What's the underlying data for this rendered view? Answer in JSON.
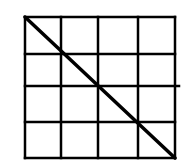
{
  "diagram": {
    "type": "grid-with-diagonal",
    "background": "#ffffff",
    "stroke_color": "#000000",
    "grid": {
      "rows": 4,
      "cols": 4,
      "x_lines": [
        25,
        61,
        98,
        138,
        175
      ],
      "y_lines": [
        17,
        54,
        86,
        122,
        158
      ],
      "stroke_width": 2.5,
      "middle_row_line_extension_right": 4
    },
    "diagonal": {
      "from": [
        25,
        17
      ],
      "to": [
        175,
        158
      ],
      "stroke_width": 3.5
    }
  }
}
